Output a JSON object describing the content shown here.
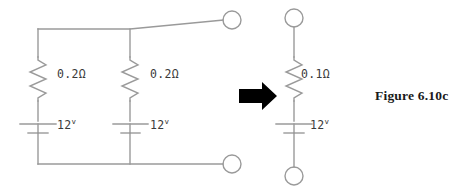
{
  "figure": {
    "caption": "Figure 6.10c",
    "background_color": "#ffffff",
    "wire_color": "#9a9a9a",
    "text_color": "#3a3a3a",
    "arrow_color": "#000000"
  },
  "left_circuit": {
    "name": "two parallel branches",
    "branches": [
      {
        "resistance": "0.2Ω",
        "voltage": "12",
        "voltage_unit": "v"
      },
      {
        "resistance": "0.2Ω",
        "voltage": "12",
        "voltage_unit": "v"
      }
    ],
    "terminals": [
      {
        "name": "top-terminal",
        "cx": 232,
        "cy": 20,
        "r": 9
      },
      {
        "name": "bottom-terminal",
        "cx": 232,
        "cy": 164,
        "r": 9
      }
    ]
  },
  "transform_arrow": {
    "name": "equivalence-arrow",
    "direction": "right",
    "x": 239,
    "y": 86,
    "width": 38,
    "height": 20
  },
  "right_circuit": {
    "name": "equivalent single branch",
    "branches": [
      {
        "resistance": "0.1Ω",
        "voltage": "12",
        "voltage_unit": "v"
      }
    ],
    "terminals": [
      {
        "name": "top-terminal",
        "cx": 294,
        "cy": 18,
        "r": 9
      },
      {
        "name": "bottom-terminal",
        "cx": 294,
        "cy": 176,
        "r": 9
      }
    ]
  }
}
